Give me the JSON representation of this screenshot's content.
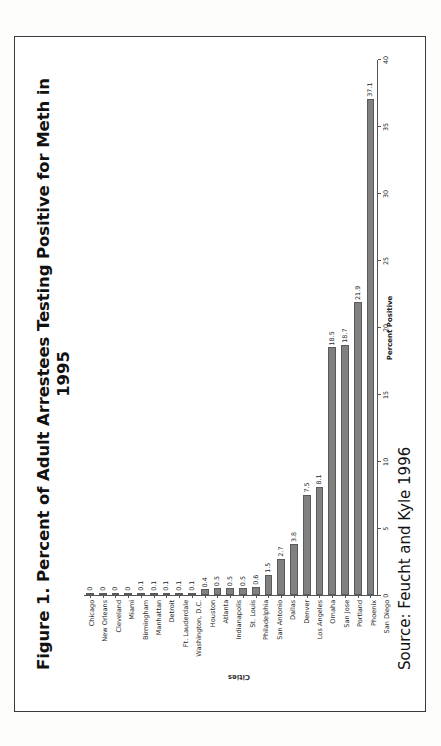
{
  "figure": {
    "title": "Figure 1. Percent of Adult Arrestees Testing Positive for Meth in 1995",
    "source": "Source: Feucht and Kyle 1996"
  },
  "chart_data": {
    "type": "bar",
    "orientation": "horizontal",
    "title": "Figure 1. Percent of Adult Arrestees Testing Positive for Meth in 1995",
    "xlabel": "Percent Positive",
    "ylabel": "Cities",
    "xlim": [
      0,
      40
    ],
    "grid": false,
    "legend": false,
    "bar_color": "#808080",
    "xticks": [
      0,
      5,
      10,
      15,
      20,
      25,
      30,
      35,
      40
    ],
    "xtick_labels": [
      "0",
      "5",
      "10",
      "15",
      "20",
      "25",
      "30",
      "35",
      "40"
    ],
    "categories": [
      "Chicago",
      "New Orleans",
      "Cleveland",
      "Miami",
      "Birmingham",
      "Manhattan",
      "Detroit",
      "Ft. Lauderdale",
      "Washington, D.C.",
      "Houston",
      "Atlanta",
      "Indianapolis",
      "St. Louis",
      "Philadelphia",
      "San Antonio",
      "Dallas",
      "Denver",
      "Los Angeles",
      "Omaha",
      "San Jose",
      "Portland",
      "Phoenix",
      "San Diego"
    ],
    "values": [
      0,
      0,
      0,
      0,
      0.1,
      0.1,
      0.1,
      0.1,
      0.1,
      0.4,
      0.5,
      0.5,
      0.5,
      0.6,
      1.5,
      2.7,
      3.8,
      7.5,
      8.1,
      18.5,
      18.7,
      21.9,
      37.1
    ],
    "value_labels": [
      "0",
      "0",
      "0",
      "0",
      "0.1",
      "0.1",
      "0.1",
      "0.1",
      "0.1",
      "0.4",
      "0.5",
      "0.5",
      "0.5",
      "0.6",
      "1.5",
      "2.7",
      "3.8",
      "7.5",
      "8.1",
      "18.5",
      "18.7",
      "21.9",
      "37.1"
    ]
  }
}
